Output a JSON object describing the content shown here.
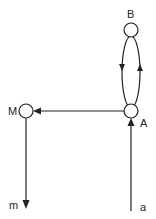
{
  "diagram": {
    "nodes": [
      {
        "id": "B",
        "label": "B",
        "cx": 131,
        "cy": 32
      },
      {
        "id": "A",
        "label": "A",
        "cx": 131,
        "cy": 111
      },
      {
        "id": "M",
        "label": "M",
        "cx": 26,
        "cy": 110
      }
    ],
    "terminals": [
      {
        "id": "a",
        "label": "a"
      },
      {
        "id": "m",
        "label": "m"
      }
    ],
    "edges": [
      {
        "from": "a",
        "to": "A",
        "direction": "up"
      },
      {
        "from": "A",
        "to": "B",
        "direction": "up",
        "side": "right"
      },
      {
        "from": "B",
        "to": "A",
        "direction": "down",
        "side": "left"
      },
      {
        "from": "A",
        "to": "M",
        "direction": "left"
      },
      {
        "from": "M",
        "to": "m",
        "direction": "down"
      }
    ],
    "colors": {
      "stroke": "#222222",
      "background": "#ffffff"
    }
  }
}
